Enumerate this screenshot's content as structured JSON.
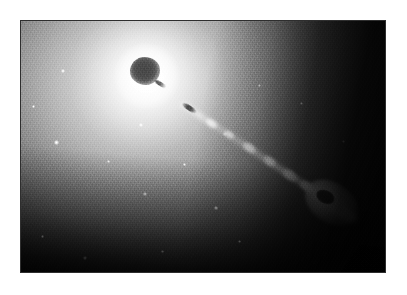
{
  "figure": {
    "kind": "astronomical-photograph",
    "color_mode": "grayscale",
    "alt": "Grayscale astronomical image of the elliptical galaxy M87 showing a bright diffuse halo, a dark saturated nucleus, and a relativistic jet of knots extending to the lower right",
    "canvas": {
      "width": 407,
      "height": 295,
      "background": "#ffffff"
    },
    "frame": {
      "left": 20,
      "top": 20,
      "width": 366,
      "height": 253,
      "border_color": "#2e2e2e",
      "border_width": 1,
      "background": "#000000"
    }
  },
  "palette": {
    "page_background": "#ffffff",
    "frame_border": "#2e2e2e",
    "sky_background": "#000000",
    "halo_bright": "#ffffff",
    "halo_mid": "#9a9a9a",
    "halo_outer": "#2a2a2a",
    "nucleus_dark": "#4a4a4a",
    "knot_bright": "#ffffff",
    "knot_dark_core": "#3c3c3c"
  },
  "features": {
    "halo": {
      "name": "galaxy-halo",
      "center_percent": {
        "x": 34.5,
        "y": 22.0
      },
      "description": "diffuse elliptical starlight fading to black toward the upper right and bottom"
    },
    "nucleus": {
      "name": "galaxy-nucleus",
      "center_percent": {
        "x": 34.0,
        "y": 20.0
      },
      "size_px": {
        "width": 30,
        "height": 28
      },
      "appearance": "dark saturated blob at the peak of the bright core"
    },
    "jet": {
      "name": "relativistic-jet",
      "origin_percent": {
        "x": 44.0,
        "y": 30.0
      },
      "angle_degrees": 33.5,
      "length_px": 212,
      "direction": "toward lower right",
      "knots": [
        {
          "name": "knot-inner-dark",
          "offset_px": 2,
          "size_px": {
            "width": 16,
            "height": 5
          },
          "tone": "dark"
        },
        {
          "name": "knot-a",
          "offset_px": 30,
          "size_px": {
            "width": 14,
            "height": 8
          },
          "tone": "bright"
        },
        {
          "name": "knot-b",
          "offset_px": 52,
          "size_px": {
            "width": 12,
            "height": 7
          },
          "tone": "bright"
        },
        {
          "name": "knot-c",
          "offset_px": 74,
          "size_px": {
            "width": 16,
            "height": 9
          },
          "tone": "bright"
        },
        {
          "name": "knot-d",
          "offset_px": 99,
          "size_px": {
            "width": 15,
            "height": 9
          },
          "tone": "bright"
        },
        {
          "name": "knot-e",
          "offset_px": 122,
          "size_px": {
            "width": 18,
            "height": 10
          },
          "tone": "bright"
        },
        {
          "name": "knot-f",
          "offset_px": 143,
          "size_px": {
            "width": 16,
            "height": 10
          },
          "tone": "bright"
        }
      ],
      "terminal_knot": {
        "name": "knot-terminal",
        "offset_px": 158,
        "size_px": {
          "width": 46,
          "height": 26
        },
        "appearance": "bright shell enclosing a dark saturated centre, with a bright trailing lobe"
      }
    },
    "point_sources": [
      {
        "name": "globular-cluster-1",
        "x_percent": 9.8,
        "y_percent": 48.5,
        "size_px": 5
      },
      {
        "name": "globular-cluster-2",
        "x_percent": 11.5,
        "y_percent": 20.0,
        "size_px": 4
      },
      {
        "name": "globular-cluster-3",
        "x_percent": 33.0,
        "y_percent": 41.5,
        "size_px": 4
      },
      {
        "name": "globular-cluster-4",
        "x_percent": 34.0,
        "y_percent": 69.0,
        "size_px": 4
      },
      {
        "name": "globular-cluster-5",
        "x_percent": 53.5,
        "y_percent": 74.5,
        "size_px": 4
      },
      {
        "name": "globular-cluster-6",
        "x_percent": 56.0,
        "y_percent": 45.0,
        "size_px": 4
      },
      {
        "name": "globular-cluster-7",
        "x_percent": 65.5,
        "y_percent": 25.5,
        "size_px": 3
      },
      {
        "name": "globular-cluster-8",
        "x_percent": 17.5,
        "y_percent": 94.5,
        "size_px": 4
      },
      {
        "name": "globular-cluster-9",
        "x_percent": 60.0,
        "y_percent": 88.0,
        "size_px": 3
      },
      {
        "name": "globular-cluster-10",
        "x_percent": 3.5,
        "y_percent": 34.0,
        "size_px": 3
      },
      {
        "name": "globular-cluster-11",
        "x_percent": 24.0,
        "y_percent": 56.0,
        "size_px": 3
      },
      {
        "name": "globular-cluster-12",
        "x_percent": 45.0,
        "y_percent": 57.0,
        "size_px": 3
      },
      {
        "name": "globular-cluster-13",
        "x_percent": 77.0,
        "y_percent": 33.0,
        "size_px": 3
      },
      {
        "name": "globular-cluster-14",
        "x_percent": 88.5,
        "y_percent": 48.0,
        "size_px": 3
      },
      {
        "name": "globular-cluster-15",
        "x_percent": 6.0,
        "y_percent": 86.0,
        "size_px": 3
      },
      {
        "name": "globular-cluster-16",
        "x_percent": 39.0,
        "y_percent": 92.0,
        "size_px": 3
      }
    ]
  }
}
